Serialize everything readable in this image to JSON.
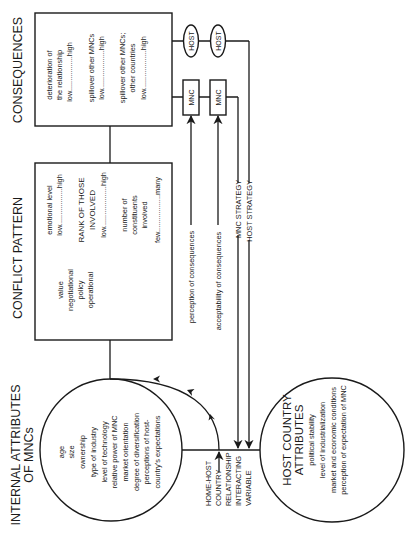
{
  "figure": {
    "orientation": "rotated-90-ccw",
    "titles": {
      "consequences": "CONSEQUENCES",
      "conflict_pattern": "CONFLICT PATTERN",
      "internal_attributes_line1": "INTERNAL ATTRIBUTES",
      "internal_attributes_line2": "OF MNCs"
    },
    "consequences_box": {
      "items": [
        "deterioration of",
        "the relationship",
        "low.................high",
        "spillover other MNCs",
        "low...................high",
        "spillover other MNCs;",
        "other countries",
        "low...................high"
      ]
    },
    "host_ovals": [
      "HOST",
      "HOST"
    ],
    "mnc_boxes": [
      "MNC",
      "MNC"
    ],
    "conflict_box": {
      "types": [
        "value",
        "negotiational",
        "policy",
        "operational"
      ],
      "dimensions": [
        "emotional level",
        "low..................high",
        "RANK OF THOSE",
        "INVOLVED",
        "low....................high",
        "number of",
        "constituents",
        "involved",
        "few..................many"
      ]
    },
    "flow_labels": {
      "perception": "perception of consequences",
      "acceptability": "acceptability of consequences",
      "mnc_strategy": "MNC STRATEGY",
      "host_strategy": "HOST STRATEGY"
    },
    "internal_attributes": {
      "items": [
        "age",
        "size",
        "ownership",
        "type of industry",
        "level of technology",
        "relative power of MNC",
        "market orientation",
        "degree of diversification",
        "perceptions of host-",
        "country's expectations"
      ]
    },
    "interacting_variable": {
      "lines": [
        "HOME-HOST",
        "COUNTRY",
        "RELATIONSHIP",
        "INTERACTING",
        "VARIABLE"
      ]
    },
    "host_country_attributes": {
      "title_line1": "HOST COUNTRY",
      "title_line2": "ATTRIBUTES",
      "items": [
        "political stability",
        "level of industrialization",
        "market and economic conditions",
        "perception of expectation of MNC"
      ]
    },
    "colors": {
      "ink": "#1a1a1a",
      "background": "#ffffff"
    }
  }
}
